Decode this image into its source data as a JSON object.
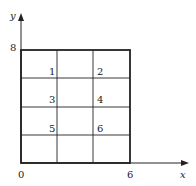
{
  "diagram": {
    "axes": {
      "x_label": "x",
      "y_label": "y",
      "origin_label": "0",
      "x_max_label": "6",
      "y_max_label": "8"
    },
    "grid": {
      "columns": 3,
      "rows": 4,
      "width_units": 6,
      "height_units": 8
    },
    "nodes": [
      {
        "label": "1"
      },
      {
        "label": "2"
      },
      {
        "label": "3"
      },
      {
        "label": "4"
      },
      {
        "label": "5"
      },
      {
        "label": "6"
      }
    ],
    "colors": {
      "line": "#222222",
      "background": "#ffffff"
    }
  }
}
